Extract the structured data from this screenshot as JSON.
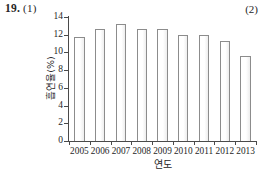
{
  "page": {
    "left_marker": "19.",
    "left_marker_sub": "(1)",
    "right_marker": "(2)"
  },
  "chart_data": {
    "type": "bar",
    "title": "",
    "xlabel": "연도",
    "ylabel": "흡연율(%)",
    "categories": [
      "2005",
      "2006",
      "2007",
      "2008",
      "2009",
      "2010",
      "2011",
      "2012",
      "2013"
    ],
    "values": [
      11.7,
      12.6,
      13.2,
      12.6,
      12.7,
      12.0,
      12.0,
      11.3,
      9.6
    ],
    "ylim": [
      0,
      14
    ],
    "yticks": [
      0,
      2,
      4,
      6,
      8,
      10,
      12,
      14
    ],
    "ytick_labels": [
      "0",
      "2",
      "4",
      "6",
      "8",
      "10",
      "12",
      "14"
    ],
    "grid": false,
    "legend": "none",
    "bar_fill": "#ffffff",
    "bar_border": "#8c8c8c",
    "axis_color": "#4a4a4a"
  }
}
